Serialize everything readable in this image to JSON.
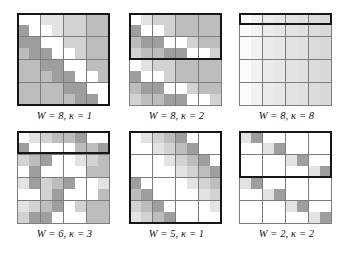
{
  "figure": {
    "background": "#ffffff",
    "grid_line_color": "#7d7d7d",
    "highlight_border_color": "#161616",
    "palette": {
      "white": "#ffffff",
      "light": "#e3e3e3",
      "mid_light": "#d2d2d2",
      "mid": "#bdbdbd",
      "dark": "#9e9e9e"
    }
  },
  "panels": [
    {
      "id": "panel-0",
      "caption": "W = 8, κ = 1",
      "W": 8,
      "kappa": 1,
      "rows": 8,
      "cols": 8,
      "highlight": {
        "row_start": 0,
        "row_count": 8,
        "col_start": 0,
        "col_count": 8
      },
      "cells": [
        [
          "#ffffff",
          "#ffffff",
          "#e3e3e3",
          "#e3e3e3",
          "#d2d2d2",
          "#d2d2d2",
          "#bdbdbd",
          "#bdbdbd"
        ],
        [
          "#9e9e9e",
          "#ffffff",
          "#ffffff",
          "#e3e3e3",
          "#d2d2d2",
          "#d2d2d2",
          "#bdbdbd",
          "#bdbdbd"
        ],
        [
          "#9e9e9e",
          "#9e9e9e",
          "#ffffff",
          "#ffffff",
          "#d2d2d2",
          "#d2d2d2",
          "#bdbdbd",
          "#bdbdbd"
        ],
        [
          "#bdbdbd",
          "#9e9e9e",
          "#9e9e9e",
          "#ffffff",
          "#ffffff",
          "#d2d2d2",
          "#bdbdbd",
          "#bdbdbd"
        ],
        [
          "#bdbdbd",
          "#bdbdbd",
          "#9e9e9e",
          "#9e9e9e",
          "#ffffff",
          "#ffffff",
          "#bdbdbd",
          "#bdbdbd"
        ],
        [
          "#bdbdbd",
          "#bdbdbd",
          "#bdbdbd",
          "#9e9e9e",
          "#9e9e9e",
          "#ffffff",
          "#ffffff",
          "#bdbdbd"
        ],
        [
          "#bdbdbd",
          "#bdbdbd",
          "#bdbdbd",
          "#bdbdbd",
          "#9e9e9e",
          "#9e9e9e",
          "#ffffff",
          "#ffffff"
        ],
        [
          "#bdbdbd",
          "#bdbdbd",
          "#bdbdbd",
          "#bdbdbd",
          "#bdbdbd",
          "#9e9e9e",
          "#9e9e9e",
          "#ffffff"
        ]
      ]
    },
    {
      "id": "panel-1",
      "caption": "W = 8, κ = 2",
      "W": 8,
      "kappa": 2,
      "rows": 8,
      "cols": 8,
      "highlight": {
        "row_start": 0,
        "row_count": 4,
        "col_start": 0,
        "col_count": 8
      },
      "cells": [
        [
          "#ffffff",
          "#e3e3e3",
          "#d2d2d2",
          "#d2d2d2",
          "#bdbdbd",
          "#bdbdbd",
          "#bdbdbd",
          "#bdbdbd"
        ],
        [
          "#9e9e9e",
          "#ffffff",
          "#ffffff",
          "#d2d2d2",
          "#bdbdbd",
          "#bdbdbd",
          "#bdbdbd",
          "#bdbdbd"
        ],
        [
          "#bdbdbd",
          "#9e9e9e",
          "#9e9e9e",
          "#ffffff",
          "#ffffff",
          "#d2d2d2",
          "#bdbdbd",
          "#bdbdbd"
        ],
        [
          "#d2d2d2",
          "#bdbdbd",
          "#bdbdbd",
          "#9e9e9e",
          "#9e9e9e",
          "#ffffff",
          "#ffffff",
          "#d2d2d2"
        ],
        [
          "#ffffff",
          "#e3e3e3",
          "#d2d2d2",
          "#d2d2d2",
          "#bdbdbd",
          "#bdbdbd",
          "#bdbdbd",
          "#bdbdbd"
        ],
        [
          "#9e9e9e",
          "#ffffff",
          "#ffffff",
          "#d2d2d2",
          "#bdbdbd",
          "#bdbdbd",
          "#bdbdbd",
          "#bdbdbd"
        ],
        [
          "#bdbdbd",
          "#9e9e9e",
          "#9e9e9e",
          "#ffffff",
          "#ffffff",
          "#d2d2d2",
          "#bdbdbd",
          "#bdbdbd"
        ],
        [
          "#d2d2d2",
          "#bdbdbd",
          "#bdbdbd",
          "#9e9e9e",
          "#9e9e9e",
          "#ffffff",
          "#ffffff",
          "#d2d2d2"
        ]
      ]
    },
    {
      "id": "panel-2",
      "caption": "W = 8, κ = 8",
      "W": 8,
      "kappa": 8,
      "rows": 8,
      "cols": 8,
      "highlight": {
        "row_start": 0,
        "row_count": 1,
        "col_start": 0,
        "col_count": 8
      },
      "cells": [
        [
          "#ffffff",
          "#f2f2f2",
          "#ebebeb",
          "#e7e7e7",
          "#e3e3e3",
          "#e0e0e0",
          "#dcdcdc",
          "#d9d9d9"
        ],
        [
          "#fbfbfb",
          "#f2f2f2",
          "#ebebeb",
          "#e7e7e7",
          "#e3e3e3",
          "#e0e0e0",
          "#dcdcdc",
          "#d9d9d9"
        ],
        [
          "#fbfbfb",
          "#f2f2f2",
          "#ebebeb",
          "#e7e7e7",
          "#e3e3e3",
          "#e0e0e0",
          "#dcdcdc",
          "#d9d9d9"
        ],
        [
          "#fbfbfb",
          "#f2f2f2",
          "#ebebeb",
          "#e7e7e7",
          "#e3e3e3",
          "#e0e0e0",
          "#dcdcdc",
          "#d9d9d9"
        ],
        [
          "#fbfbfb",
          "#f2f2f2",
          "#ebebeb",
          "#e7e7e7",
          "#e3e3e3",
          "#e0e0e0",
          "#dcdcdc",
          "#d9d9d9"
        ],
        [
          "#fbfbfb",
          "#f2f2f2",
          "#ebebeb",
          "#e7e7e7",
          "#e3e3e3",
          "#e0e0e0",
          "#dcdcdc",
          "#d9d9d9"
        ],
        [
          "#fbfbfb",
          "#f2f2f2",
          "#ebebeb",
          "#e7e7e7",
          "#e3e3e3",
          "#e0e0e0",
          "#dcdcdc",
          "#d9d9d9"
        ],
        [
          "#fbfbfb",
          "#f2f2f2",
          "#ebebeb",
          "#e7e7e7",
          "#e3e3e3",
          "#e0e0e0",
          "#dcdcdc",
          "#d9d9d9"
        ]
      ]
    },
    {
      "id": "panel-3",
      "caption": "W = 6, κ = 3",
      "W": 6,
      "kappa": 3,
      "rows": 8,
      "cols": 8,
      "highlight": {
        "row_start": 0,
        "row_count": 2,
        "col_start": 0,
        "col_count": 8
      },
      "cells": [
        [
          "#ffffff",
          "#e3e3e3",
          "#d2d2d2",
          "#bdbdbd",
          "#bdbdbd",
          "#9e9e9e",
          "#ffffff",
          "#ffffff"
        ],
        [
          "#9e9e9e",
          "#ffffff",
          "#ffffff",
          "#ffffff",
          "#ffffff",
          "#bdbdbd",
          "#bdbdbd",
          "#9e9e9e"
        ],
        [
          "#d2d2d2",
          "#bdbdbd",
          "#9e9e9e",
          "#ffffff",
          "#ffffff",
          "#e3e3e3",
          "#d2d2d2",
          "#bdbdbd"
        ],
        [
          "#ffffff",
          "#9e9e9e",
          "#ffffff",
          "#ffffff",
          "#ffffff",
          "#ffffff",
          "#bdbdbd",
          "#bdbdbd"
        ],
        [
          "#e3e3e3",
          "#9e9e9e",
          "#d2d2d2",
          "#bdbdbd",
          "#9e9e9e",
          "#ffffff",
          "#ffffff",
          "#e3e3e3"
        ],
        [
          "#ffffff",
          "#ffffff",
          "#d2d2d2",
          "#9e9e9e",
          "#ffffff",
          "#ffffff",
          "#ffffff",
          "#bdbdbd"
        ],
        [
          "#e3e3e3",
          "#d2d2d2",
          "#bdbdbd",
          "#9e9e9e",
          "#ffffff",
          "#d2d2d2",
          "#bdbdbd",
          "#bdbdbd"
        ],
        [
          "#d2d2d2",
          "#9e9e9e",
          "#9e9e9e",
          "#ffffff",
          "#ffffff",
          "#ffffff",
          "#bdbdbd",
          "#bdbdbd"
        ]
      ]
    },
    {
      "id": "panel-4",
      "caption": "W = 5, κ = 1",
      "W": 5,
      "kappa": 1,
      "rows": 8,
      "cols": 8,
      "highlight": {
        "row_start": 0,
        "row_count": 8,
        "col_start": 0,
        "col_count": 8
      },
      "cells": [
        [
          "#ffffff",
          "#e3e3e3",
          "#d2d2d2",
          "#bdbdbd",
          "#9e9e9e",
          "#ffffff",
          "#ffffff",
          "#ffffff"
        ],
        [
          "#ffffff",
          "#ffffff",
          "#e3e3e3",
          "#d2d2d2",
          "#bdbdbd",
          "#9e9e9e",
          "#ffffff",
          "#ffffff"
        ],
        [
          "#ffffff",
          "#ffffff",
          "#ffffff",
          "#e3e3e3",
          "#d2d2d2",
          "#bdbdbd",
          "#9e9e9e",
          "#ffffff"
        ],
        [
          "#ffffff",
          "#ffffff",
          "#ffffff",
          "#ffffff",
          "#e3e3e3",
          "#d2d2d2",
          "#bdbdbd",
          "#9e9e9e"
        ],
        [
          "#9e9e9e",
          "#ffffff",
          "#ffffff",
          "#ffffff",
          "#ffffff",
          "#e3e3e3",
          "#d2d2d2",
          "#bdbdbd"
        ],
        [
          "#bdbdbd",
          "#9e9e9e",
          "#ffffff",
          "#ffffff",
          "#ffffff",
          "#ffffff",
          "#e3e3e3",
          "#d2d2d2"
        ],
        [
          "#d2d2d2",
          "#bdbdbd",
          "#9e9e9e",
          "#ffffff",
          "#ffffff",
          "#ffffff",
          "#ffffff",
          "#e3e3e3"
        ],
        [
          "#e3e3e3",
          "#d2d2d2",
          "#bdbdbd",
          "#9e9e9e",
          "#ffffff",
          "#ffffff",
          "#ffffff",
          "#ffffff"
        ]
      ]
    },
    {
      "id": "panel-5",
      "caption": "W = 2, κ = 2",
      "W": 2,
      "kappa": 2,
      "rows": 8,
      "cols": 8,
      "highlight": {
        "row_start": 0,
        "row_count": 4,
        "col_start": 0,
        "col_count": 8
      },
      "cells": [
        [
          "#e3e3e3",
          "#9e9e9e",
          "#ffffff",
          "#ffffff",
          "#ffffff",
          "#ffffff",
          "#ffffff",
          "#ffffff"
        ],
        [
          "#ffffff",
          "#ffffff",
          "#e3e3e3",
          "#9e9e9e",
          "#ffffff",
          "#ffffff",
          "#ffffff",
          "#ffffff"
        ],
        [
          "#ffffff",
          "#ffffff",
          "#ffffff",
          "#ffffff",
          "#e3e3e3",
          "#9e9e9e",
          "#ffffff",
          "#ffffff"
        ],
        [
          "#ffffff",
          "#ffffff",
          "#ffffff",
          "#ffffff",
          "#ffffff",
          "#ffffff",
          "#e3e3e3",
          "#9e9e9e"
        ],
        [
          "#e3e3e3",
          "#9e9e9e",
          "#ffffff",
          "#ffffff",
          "#ffffff",
          "#ffffff",
          "#ffffff",
          "#ffffff"
        ],
        [
          "#ffffff",
          "#ffffff",
          "#e3e3e3",
          "#9e9e9e",
          "#ffffff",
          "#ffffff",
          "#ffffff",
          "#ffffff"
        ],
        [
          "#ffffff",
          "#ffffff",
          "#ffffff",
          "#ffffff",
          "#e3e3e3",
          "#9e9e9e",
          "#ffffff",
          "#ffffff"
        ],
        [
          "#ffffff",
          "#ffffff",
          "#ffffff",
          "#ffffff",
          "#ffffff",
          "#ffffff",
          "#e3e3e3",
          "#9e9e9e"
        ]
      ]
    }
  ]
}
